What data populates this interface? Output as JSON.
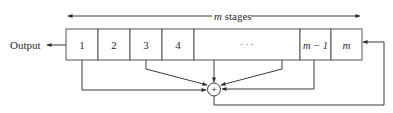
{
  "diagram": {
    "type": "shift-register-feedback",
    "output_label": "Output",
    "stages_label_var": "m",
    "stages_label_text": " stages",
    "cells": [
      {
        "label": "1",
        "italic": false
      },
      {
        "label": "2",
        "italic": false
      },
      {
        "label": "3",
        "italic": false
      },
      {
        "label": "4",
        "italic": false
      },
      {
        "label": "· · ·",
        "italic": false
      },
      {
        "label": "m − 1",
        "italic": true
      },
      {
        "label": "m",
        "italic": true
      }
    ],
    "adder_symbol": "+",
    "taps": [
      "1",
      "3",
      "· · ·",
      "m − 1"
    ],
    "feedback_target": "m",
    "colors": {
      "line": "#3a3a3a",
      "text": "#2a2a2a",
      "background": "#ffffff"
    }
  }
}
